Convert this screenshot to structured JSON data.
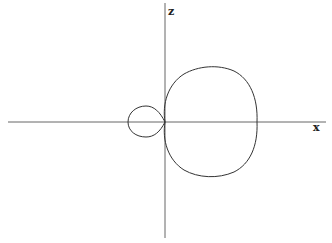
{
  "diagram": {
    "type": "polar-pattern",
    "axes": {
      "horizontal_label": "x",
      "vertical_label": "z"
    },
    "colors": {
      "stroke": "#333333",
      "axis": "#555555",
      "background": "#ffffff"
    },
    "lobes": [
      {
        "name": "main-lobe",
        "direction": "+x",
        "relative_size": "large"
      },
      {
        "name": "back-lobe",
        "direction": "-x",
        "relative_size": "small"
      }
    ]
  }
}
